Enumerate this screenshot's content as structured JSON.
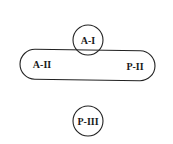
{
  "diagram": {
    "nodes": [
      {
        "id": "a1",
        "label": "A-I",
        "shape": "circle"
      },
      {
        "id": "group",
        "shape": "capsule",
        "labels": [
          "A-II",
          "P-II"
        ]
      },
      {
        "id": "p3",
        "label": "P-III",
        "shape": "circle"
      }
    ],
    "colors": {
      "stroke": "#222222",
      "text": "#1a1a1a",
      "background": "#ffffff"
    }
  }
}
